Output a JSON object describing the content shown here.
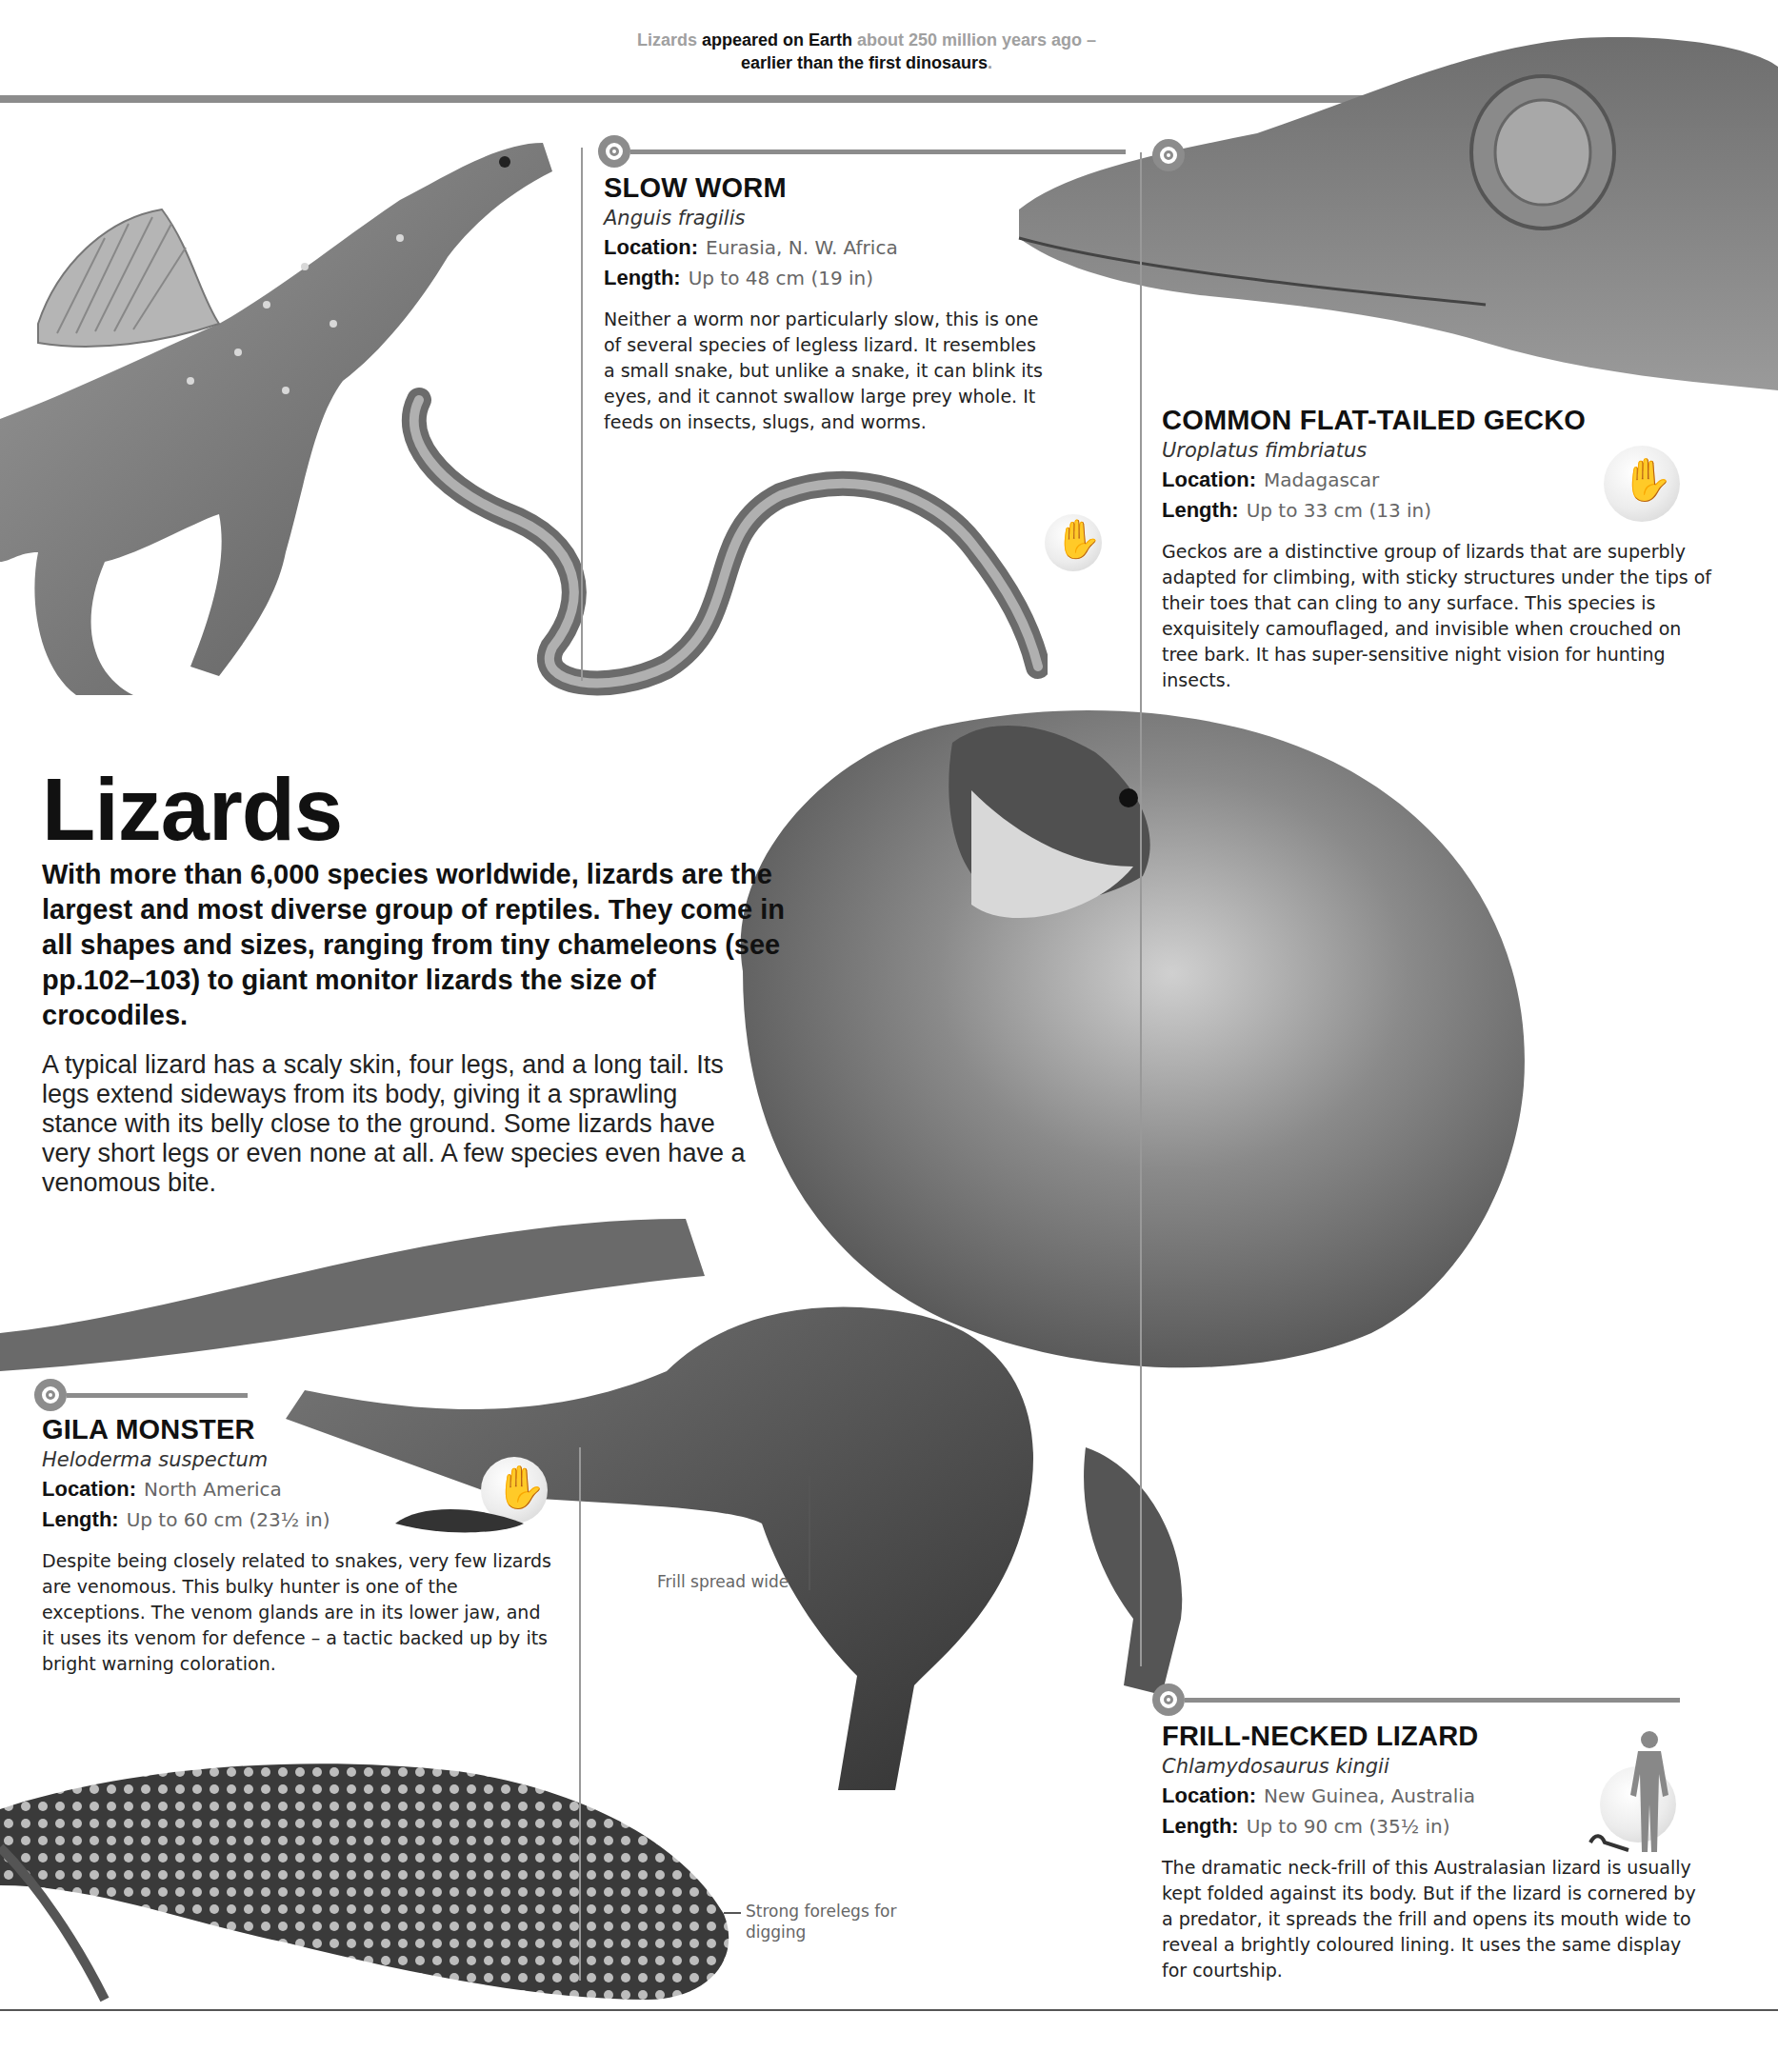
{
  "page": {
    "top_fact": {
      "parts": [
        {
          "text": "Lizards ",
          "style": "grey"
        },
        {
          "text": "appeared on Earth ",
          "style": "dark"
        },
        {
          "text": "about 250 million years ago – ",
          "style": "grey"
        },
        {
          "text": "earlier than the first dinosaurs",
          "style": "dark"
        },
        {
          "text": ".",
          "style": "grey"
        }
      ]
    },
    "title": "Lizards",
    "lede": "With more than 6,000 species worldwide, lizards are the largest and most diverse group of reptiles. They come in all shapes and sizes, ranging from tiny chameleons (see pp.102–103) to giant monitor lizards the size of crocodiles.",
    "body": "A typical lizard has a scaly skin, four legs, and a long tail. Its legs extend sideways from its body, giving it a sprawling stance with its belly close to the ground. Some lizards have very short legs or even none at all. A few species even have a venomous bite.",
    "labels": {
      "location": "Location:",
      "length": "Length:"
    },
    "captions": {
      "frill": "Frill spread wide",
      "forelegs": "Strong forelegs for digging"
    },
    "entries": {
      "slow_worm": {
        "name": "SLOW WORM",
        "scientific": "Anguis fragilis",
        "location": "Eurasia, N. W. Africa",
        "length": "Up to 48 cm (19 in)",
        "description": "Neither a worm nor particularly slow, this is one of several species of legless lizard. It resembles a small snake, but unlike a snake, it can blink its eyes, and it cannot swallow large prey whole. It feeds on insects, slugs, and worms.",
        "size_comparison": "hand-icon"
      },
      "gecko": {
        "name": "COMMON FLAT-TAILED GECKO",
        "scientific": "Uroplatus fimbriatus",
        "location": "Madagascar",
        "length": "Up to 33 cm (13 in)",
        "description": "Geckos are a distinctive group of lizards that are superbly adapted for climbing, with sticky structures under the tips of their toes that can cling to any surface. This species is exquisitely camouflaged, and invisible when crouched on tree bark. It has super-sensitive night vision for hunting insects.",
        "size_comparison": "hand-icon"
      },
      "gila": {
        "name": "GILA MONSTER",
        "scientific": "Heloderma suspectum",
        "location": "North America",
        "length": "Up to 60 cm (23½ in)",
        "description": "Despite being closely related to snakes, very few lizards are venomous. This bulky hunter is one of the exceptions. The venom glands are in its lower jaw, and it uses its venom for defence – a tactic backed up by its bright warning coloration.",
        "size_comparison": "hand-icon"
      },
      "frill": {
        "name": "FRILL-NECKED LIZARD",
        "scientific": "Chlamydosaurus kingii",
        "location": "New Guinea, Australia",
        "length": "Up to 90 cm (35½ in)",
        "description": "The dramatic neck-frill of this Australasian lizard is usually kept folded against its body. But if the lizard is cornered by a predator, it spreads the frill and opens its mouth wide to reveal a brightly coloured lining. It uses the same display for courtship.",
        "size_comparison": "human-figure-icon"
      }
    },
    "colors": {
      "rule_grey": "#8c8c8c",
      "text_dark": "#111111",
      "text_grey": "#a0a0a0"
    }
  }
}
